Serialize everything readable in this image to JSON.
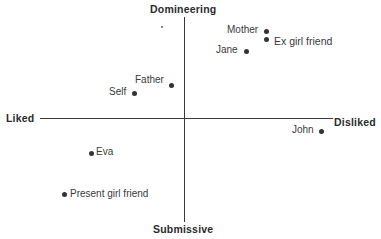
{
  "diagram": {
    "type": "two-axis scatter diagram",
    "axes": {
      "top": "Domineering",
      "bottom": "Submissive",
      "left": "Liked",
      "right": "Disliked"
    },
    "points": [
      {
        "label": "Mother",
        "x": 266,
        "y": 31,
        "label_side": "left"
      },
      {
        "label": "Ex girl friend",
        "x": 266,
        "y": 40,
        "label_side": "right"
      },
      {
        "label": "Jane",
        "x": 246,
        "y": 51,
        "label_side": "left"
      },
      {
        "label": "Father",
        "x": 171,
        "y": 85,
        "label_side": "left-above"
      },
      {
        "label": "Self",
        "x": 134,
        "y": 93,
        "label_side": "left"
      },
      {
        "label": "John",
        "x": 321,
        "y": 131,
        "label_side": "left"
      },
      {
        "label": "Eva",
        "x": 91,
        "y": 153,
        "label_side": "right"
      },
      {
        "label": "Present girl friend",
        "x": 64,
        "y": 195,
        "label_side": "right"
      }
    ],
    "colors": {
      "ink": "#333333",
      "background": "#ffffff"
    }
  }
}
